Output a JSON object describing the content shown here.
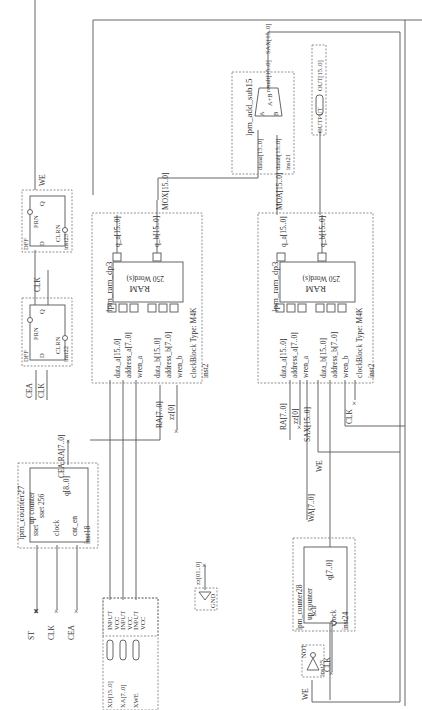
{
  "diagram": {
    "type": "quartus-block-schematic",
    "orientation": "rotated-90",
    "counter_a": {
      "title": "lpm_counter27",
      "subtitle": "up counter",
      "param": "sset 256",
      "ports_in": [
        "sset",
        "clock",
        "cnt_en"
      ],
      "port_out": "q[8..0]",
      "inst": "inst18",
      "out_net": "CEA,RA[7..0]",
      "in_nets": [
        "ST",
        "CLK",
        "CEA"
      ]
    },
    "dff_a": {
      "title": "DFF",
      "pins": [
        "PRN",
        "D",
        "Q",
        "CLRN"
      ],
      "inst": "inst22",
      "in_nets": [
        "CEA",
        "CLK"
      ]
    },
    "dff_b": {
      "title": "DFF",
      "pins": [
        "PRN",
        "D",
        "Q",
        "CLRN"
      ],
      "inst": "inst23",
      "out_net": "WE",
      "in_net": "CLK"
    },
    "inputs": [
      {
        "name": "XD[15..0]",
        "type": "INPUT",
        "default": "VCC"
      },
      {
        "name": "XA[7..0]",
        "type": "INPUT",
        "default": "VCC"
      },
      {
        "name": "XWE",
        "type": "INPUT",
        "default": "VCC"
      }
    ],
    "ram1": {
      "title": "lpm_ram_dp3",
      "core": "RAM",
      "words": "250 Word(s)",
      "ports_in": [
        "data_a[15..0]",
        "address_a[7..0]",
        "wren_a",
        "data_b[15..0]",
        "address_b[7..0]",
        "wren_b",
        "clock"
      ],
      "ports_out": [
        "q_a[15..0]",
        "q_b[15..0]"
      ],
      "block_type": "Block Type: M4K",
      "inst": "inst2",
      "out_net": "MOX[15..0]",
      "in_nets": [
        "RA[7..0]",
        "zz[0]"
      ]
    },
    "ram2": {
      "title": "lpm_ram_dp3",
      "core": "RAM",
      "words": "250 Word(s)",
      "ports_in": [
        "data_a[15..0]",
        "address_a[7..0]",
        "wren_a",
        "data_b[15..0]",
        "address_b[7..0]",
        "wren_b",
        "clock"
      ],
      "ports_out": [
        "q_a[15..0]",
        "q_b[15..0]"
      ],
      "block_type": "Block Type: M4K",
      "inst": "inst2",
      "out_net": "MOA[15..0]",
      "in_nets": [
        "RA[7..0]",
        "zz[0]",
        "SAX[15..0]",
        "WE",
        "CLK"
      ]
    },
    "adder": {
      "title": "lpm_add_sub15",
      "ports_in": [
        "dataa[15..0]",
        "datab[15..0]"
      ],
      "port_out": "result[15..0]",
      "op": "A+B",
      "pin_a": "A",
      "pin_b": "B",
      "inst": "inst21",
      "out_net": "SAX[15..0]"
    },
    "output": {
      "type": "OUTPUT",
      "name": "OUT[15..0]"
    },
    "gnd": {
      "label": "GND",
      "net": "zz[01..0]"
    },
    "counter_b": {
      "title": "lpm_counter28",
      "subtitle": "up counter",
      "ports_in": [
        "sclr",
        "clock"
      ],
      "port_out": "q[7..0]",
      "inst": "inst24",
      "out_net": "WA[7..0]"
    },
    "not_gate": {
      "title": "NOT",
      "inst": "inst25",
      "in_net": "WE",
      "clk_net": "CLK"
    }
  }
}
